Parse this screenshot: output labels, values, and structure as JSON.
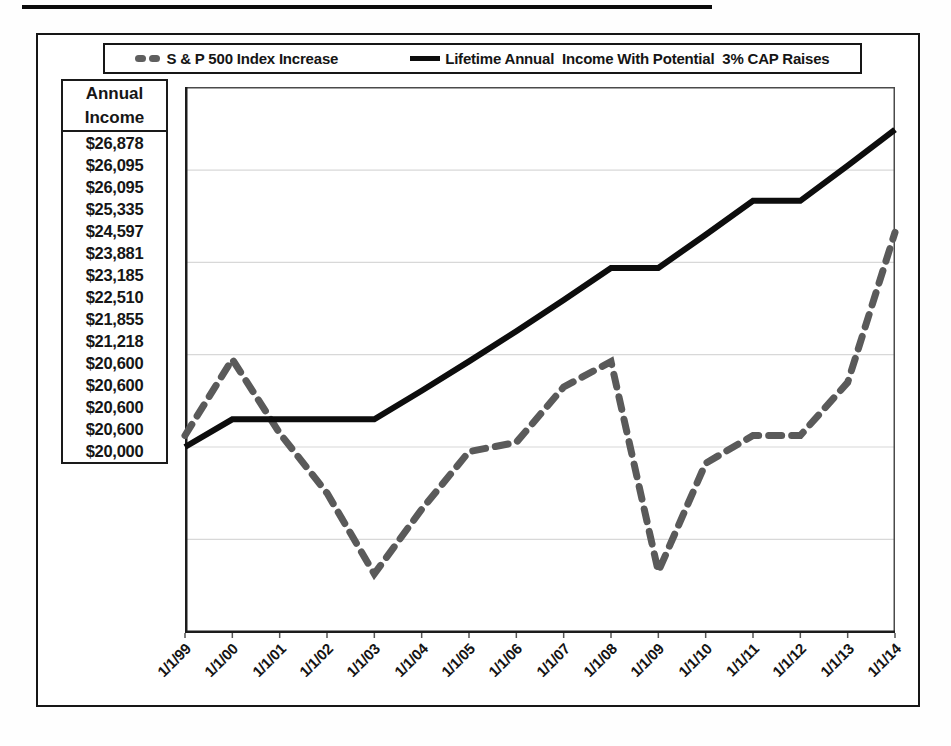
{
  "legend": {
    "items": [
      {
        "label": "S & P 500 Index Increase",
        "marker": "gray-dash-marker",
        "color": "#5f5f5f"
      },
      {
        "label": "Lifetime Annual  Income With Potential  3% CAP Raises",
        "marker": "black-line-marker",
        "color": "#0d0d0d"
      }
    ]
  },
  "income_table": {
    "header_line1": "Annual",
    "header_line2": "Income",
    "values": [
      "$26,878",
      "$26,095",
      "$26,095",
      "$25,335",
      "$24,597",
      "$23,881",
      "$23,185",
      "$22,510",
      "$21,855",
      "$21,218",
      "$20,600",
      "$20,600",
      "$20,600",
      "$20,600",
      "$20,000"
    ]
  },
  "chart_data": {
    "type": "line",
    "title": "",
    "xlabel": "",
    "ylabel": "Annual Income",
    "x_labels": [
      "1/1/99",
      "1/1/00",
      "1/1/01",
      "1/1/02",
      "1/1/03",
      "1/1/04",
      "1/1/05",
      "1/1/06",
      "1/1/07",
      "1/1/08",
      "1/1/09",
      "1/1/10",
      "1/1/11",
      "1/1/12",
      "1/1/13",
      "1/1/14"
    ],
    "series": [
      {
        "name": "S & P 500 Index Increase",
        "style": "dashed",
        "color": "#5a5a5a",
        "values": [
          20250,
          21900,
          20300,
          19000,
          17250,
          18650,
          19900,
          20100,
          21300,
          21850,
          17300,
          19650,
          20250,
          20250,
          21400,
          24650
        ]
      },
      {
        "name": "Lifetime Annual  Income With Potential  3% CAP Raises",
        "style": "solid",
        "color": "#0d0d0d",
        "values": [
          20000,
          20600,
          20600,
          20600,
          20600,
          21218,
          21855,
          22510,
          23185,
          23881,
          23881,
          24597,
          25335,
          25335,
          26095,
          26878
        ]
      }
    ],
    "ylim": [
      16000,
      28000
    ],
    "gridline_values": [
      18000,
      20000,
      22000,
      24000,
      26000
    ],
    "grid": true,
    "legend_position": "top"
  }
}
